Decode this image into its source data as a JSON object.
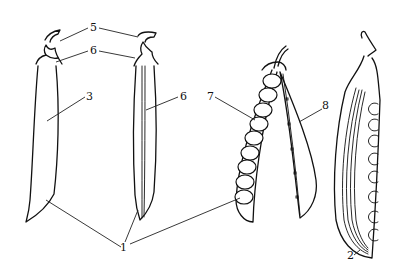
{
  "figure": {
    "type": "botanical line drawing",
    "labels": [
      {
        "id": "1",
        "text": "1",
        "x": 123,
        "y": 121
      },
      {
        "id": "2",
        "text": "2",
        "x": 137,
        "y": 127
      },
      {
        "id": "3",
        "text": "3",
        "x": 88,
        "y": 97
      },
      {
        "id": "4",
        "text": "4",
        "x": 93,
        "y": 28
      },
      {
        "id": "5",
        "text": "5",
        "x": 93,
        "y": 51
      },
      {
        "id": "6",
        "text": "6",
        "x": 181,
        "y": 97
      },
      {
        "id": "7",
        "text": "7",
        "x": 209,
        "y": 97
      },
      {
        "id": "8",
        "text": "8",
        "x": 325,
        "y": 109
      }
    ],
    "seed_count_open_pod": 10,
    "seed_count_cross_pod": 8
  }
}
